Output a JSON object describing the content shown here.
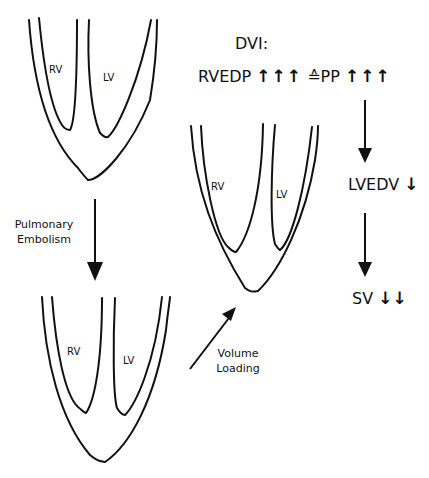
{
  "hearts": {
    "top": {
      "rv_label": "RV",
      "lv_label": "LV"
    },
    "middle": {
      "rv_label": "RV",
      "lv_label": "LV"
    },
    "bottom": {
      "rv_label": "RV",
      "lv_label": "LV"
    }
  },
  "transitions": {
    "pulmonary_embolism": {
      "line1": "Pulmonary",
      "line2": "Embolism"
    },
    "volume_loading": {
      "line1": "Volume",
      "line2": "Loading"
    }
  },
  "cascade": {
    "title": "DVI:",
    "rvedp_label": "RVEDP",
    "rvedp_arrows": "↑↑↑",
    "equiv_symbol": "≙",
    "pp_label": "PP",
    "pp_arrows": "↑↑↑",
    "lvedv_label": "LVEDV",
    "lvedv_arrows": "↓",
    "sv_label": "SV",
    "sv_arrows": "↓↓"
  },
  "colors": {
    "stroke": "#111111",
    "background": "#ffffff"
  }
}
